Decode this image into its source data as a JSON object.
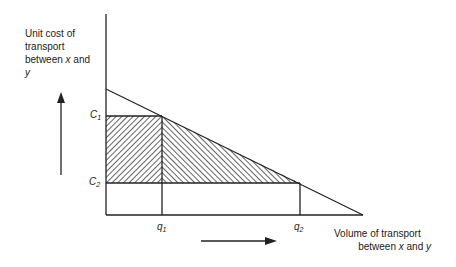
{
  "y_axis_label": {
    "line1": "Unit cost of",
    "line2": "transport",
    "line3_prefix": "between ",
    "line3_var": "x",
    "line3_suffix": " and",
    "line4_var": "y"
  },
  "x_axis_label": {
    "line1": "Volume of transport",
    "line2_prefix": "between ",
    "line2_var1": "x",
    "line2_mid": " and ",
    "line2_var2": "y"
  },
  "price_labels": [
    {
      "base": "C",
      "sub": "1"
    },
    {
      "base": "C",
      "sub": "2"
    }
  ],
  "quantity_labels": [
    {
      "base": "q",
      "sub": "1"
    },
    {
      "base": "q",
      "sub": "2"
    }
  ],
  "colors": {
    "ink": "#222222",
    "background": "#ffffff"
  },
  "geometry": {
    "origin": [
      106,
      215
    ],
    "y_axis_top": 14,
    "x_axis_end": 363,
    "demand_line": [
      [
        106,
        89
      ],
      [
        363,
        215
      ]
    ],
    "C1_y": 116,
    "C2_y": 183,
    "q1_x": 162,
    "q2_x": 300
  }
}
